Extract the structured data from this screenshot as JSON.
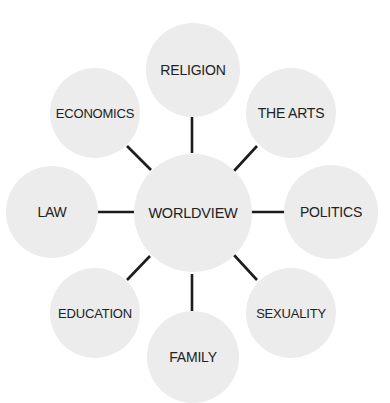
{
  "diagram": {
    "title": "",
    "canvas": {
      "width": 390,
      "height": 403,
      "background": "#ffffff"
    },
    "colors": {
      "circle_fill": "#ececec",
      "connector": "#1c1c1c",
      "text": "#222222"
    },
    "center": {
      "id": "worldview",
      "label": "WORLDVIEW",
      "cx": 193,
      "cy": 213,
      "r": 59,
      "font_size": 14.5
    },
    "nodes": [
      {
        "id": "religion",
        "label": "RELIGION",
        "cx": 193,
        "cy": 70,
        "r": 47,
        "font_size": 14,
        "connector": {
          "x1": 192,
          "y1": 115,
          "x2": 192,
          "y2": 153
        }
      },
      {
        "id": "the-arts",
        "label": "THE ARTS",
        "cx": 291,
        "cy": 113,
        "r": 45,
        "font_size": 14,
        "connector": {
          "x1": 257,
          "y1": 146,
          "x2": 234,
          "y2": 171
        }
      },
      {
        "id": "politics",
        "label": "POLITICS",
        "cx": 331,
        "cy": 212,
        "r": 47,
        "font_size": 14,
        "connector": {
          "x1": 251,
          "y1": 212,
          "x2": 288,
          "y2": 212
        }
      },
      {
        "id": "sexuality",
        "label": "SEXUALITY",
        "cx": 291,
        "cy": 313,
        "r": 45,
        "font_size": 13,
        "connector": {
          "x1": 234,
          "y1": 255,
          "x2": 257,
          "y2": 280
        }
      },
      {
        "id": "family",
        "label": "FAMILY",
        "cx": 193,
        "cy": 357,
        "r": 46,
        "font_size": 14,
        "connector": {
          "x1": 192,
          "y1": 274,
          "x2": 192,
          "y2": 311
        }
      },
      {
        "id": "education",
        "label": "EDUCATION",
        "cx": 95,
        "cy": 313,
        "r": 45,
        "font_size": 13,
        "connector": {
          "x1": 127,
          "y1": 280,
          "x2": 150,
          "y2": 256
        }
      },
      {
        "id": "law",
        "label": "LAW",
        "cx": 52,
        "cy": 212,
        "r": 46,
        "font_size": 14,
        "connector": {
          "x1": 97,
          "y1": 212,
          "x2": 134,
          "y2": 212
        }
      },
      {
        "id": "economics",
        "label": "ECONOMICS",
        "cx": 95,
        "cy": 113,
        "r": 45,
        "font_size": 13,
        "connector": {
          "x1": 127,
          "y1": 146,
          "x2": 151,
          "y2": 170
        }
      }
    ]
  }
}
